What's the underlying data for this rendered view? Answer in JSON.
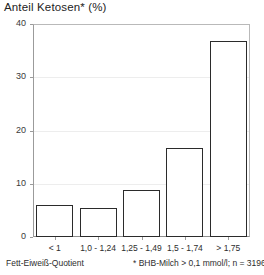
{
  "chart_data": {
    "type": "bar",
    "title": "Anteil Ketosen* (%)",
    "xlabel": "Fett-Eiweiß-Quotient",
    "ylabel": "",
    "categories": [
      "< 1",
      "1,0 - 1,24",
      "1,25 - 1,49",
      "1,5 - 1,74",
      "> 1,75"
    ],
    "values": [
      6.1,
      5.4,
      8.9,
      16.7,
      36.8
    ],
    "ylim": [
      0,
      40
    ],
    "yticks": [
      0,
      10,
      20,
      30,
      40
    ],
    "ytick_labels": [
      "0",
      "10",
      "20",
      "30",
      "40"
    ],
    "grid": true,
    "legend": null,
    "annotations": [
      "Fett-Eiweiß-Quotient",
      "* BHB-Milch > 0,1 mmol/l; n = 3196"
    ],
    "bar_style": {
      "fill": "#ffffff",
      "edge": "#2b2b2b"
    }
  },
  "footnotes": {
    "left": "Fett-Eiweiß-Quotient",
    "right": "* BHB-Milch > 0,1 mmol/l; n = 3196"
  }
}
